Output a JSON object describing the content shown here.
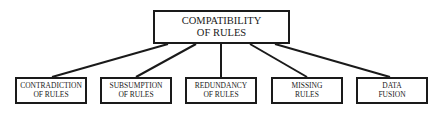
{
  "diagram": {
    "root": {
      "line1": "COMPATIBILITY",
      "line2": "OF RULES"
    },
    "children": [
      {
        "line1": "CONTRADICTION",
        "line2": "OF RULES"
      },
      {
        "line1": "SUBSUMPTION",
        "line2": "OF RULES"
      },
      {
        "line1": "REDUNDANCY",
        "line2": "OF RULES"
      },
      {
        "line1": "MISSING",
        "line2": "RULES"
      },
      {
        "line1": "DATA",
        "line2": "FUSION"
      }
    ],
    "colors": {
      "stroke": "#1a1a1a",
      "background": "#ffffff"
    }
  }
}
